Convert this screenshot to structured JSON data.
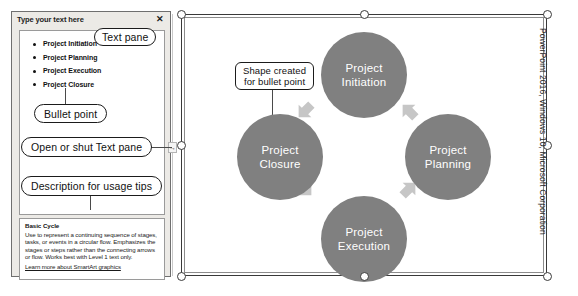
{
  "text_pane": {
    "title": "Type your text here",
    "close_icon": "close-icon",
    "close_glyph": "✕",
    "toggle_glyph": "→",
    "bullets": [
      "Project Initiation",
      "Project Planning",
      "Project Execution",
      "Project Closure"
    ],
    "description": {
      "title": "Basic Cycle",
      "body": "Use to represent a continuing sequence of stages, tasks, or events in a circular flow. Emphasizes the stages or steps rather than the connecting arrows or flow. Works best with Level 1 text only.",
      "link": "Learn more about SmartArt graphics"
    }
  },
  "annotations": {
    "text_pane_label": "Text pane",
    "bullet_point_label": "Bullet point",
    "open_shut_label": "Open or shut Text pane",
    "description_label": "Description for usage tips",
    "shape_created_line1": "Shape created",
    "shape_created_line2": "for bullet point"
  },
  "diagram": {
    "nodes": [
      {
        "line1": "Project",
        "line2": "Initiation"
      },
      {
        "line1": "Project",
        "line2": "Planning"
      },
      {
        "line1": "Project",
        "line2": "Execution"
      },
      {
        "line1": "Project",
        "line2": "Closure"
      }
    ],
    "node_color": "#808080",
    "arrow_color": "#c6c6c6"
  },
  "credit": "PowerPoint 2016, Windows 10, Microsoft Corporation",
  "bottom_caption": ""
}
